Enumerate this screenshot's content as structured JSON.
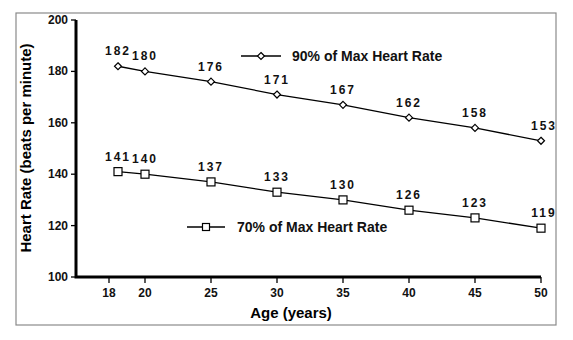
{
  "chart_data": {
    "type": "line",
    "title": "",
    "xlabel": "Age (years)",
    "ylabel": "Heart Rate (beats per minute)",
    "x": [
      18,
      20,
      25,
      30,
      35,
      40,
      45,
      50
    ],
    "x_tick_labels": [
      "18",
      "20",
      "25",
      "30",
      "35",
      "40",
      "45",
      "50"
    ],
    "y_tick_labels": [
      "100",
      "120",
      "140",
      "160",
      "180",
      "200"
    ],
    "ylim": [
      100,
      200
    ],
    "grid": false,
    "legend_position": "inside",
    "series": [
      {
        "name": "90% of Max Heart Rate",
        "marker": "diamond",
        "values": [
          182,
          180,
          176,
          171,
          167,
          162,
          158,
          153
        ]
      },
      {
        "name": "70% of Max Heart Rate",
        "marker": "square",
        "values": [
          141,
          140,
          137,
          133,
          130,
          126,
          123,
          119
        ]
      }
    ]
  },
  "colors": {
    "line": "#000000",
    "frame": "#8a8a8a",
    "background": "#ffffff"
  }
}
